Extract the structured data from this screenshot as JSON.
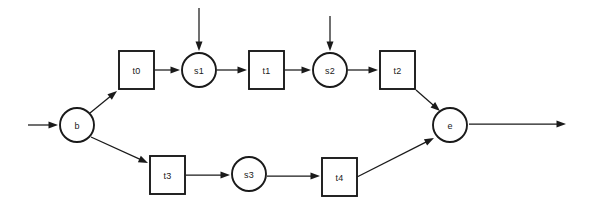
{
  "diagram": {
    "type": "petri-net",
    "width": 596,
    "height": 212,
    "background_color": "#ffffff",
    "stroke_color": "#1a1a1a",
    "places": [
      {
        "id": "b",
        "label": "b",
        "cx": 77,
        "cy": 125,
        "r": 17
      },
      {
        "id": "s1",
        "label": "s1",
        "cx": 199,
        "cy": 70,
        "r": 17
      },
      {
        "id": "s2",
        "label": "s2",
        "cx": 330,
        "cy": 70,
        "r": 17
      },
      {
        "id": "s3",
        "label": "s3",
        "cx": 249,
        "cy": 174,
        "r": 17
      },
      {
        "id": "e",
        "label": "e",
        "cx": 450,
        "cy": 125,
        "r": 17
      }
    ],
    "transitions": [
      {
        "id": "t0",
        "label": "t0",
        "x": 119,
        "y": 51,
        "w": 35,
        "h": 38
      },
      {
        "id": "t1",
        "label": "t1",
        "x": 249,
        "y": 51,
        "w": 35,
        "h": 38
      },
      {
        "id": "t2",
        "label": "t2",
        "x": 380,
        "y": 51,
        "w": 35,
        "h": 38
      },
      {
        "id": "t3",
        "label": "t3",
        "x": 150,
        "y": 156,
        "w": 35,
        "h": 38
      },
      {
        "id": "t4",
        "label": "t4",
        "x": 322,
        "y": 158,
        "w": 35,
        "h": 38
      }
    ],
    "arcs": [
      {
        "id": "arc-in-b",
        "from": "input",
        "to": "b",
        "x1": 28,
        "y1": 125,
        "x2": 58,
        "y2": 125
      },
      {
        "id": "arc-b-t0",
        "from": "b",
        "to": "t0",
        "x1": 90,
        "y1": 113,
        "x2": 117,
        "y2": 91
      },
      {
        "id": "arc-t0-s1",
        "from": "t0",
        "to": "s1",
        "x1": 155,
        "y1": 70,
        "x2": 180,
        "y2": 70
      },
      {
        "id": "arc-in-s1",
        "from": "input",
        "to": "s1",
        "x1": 199,
        "y1": 8,
        "x2": 199,
        "y2": 51
      },
      {
        "id": "arc-s1-t1",
        "from": "s1",
        "to": "t1",
        "x1": 217,
        "y1": 70,
        "x2": 247,
        "y2": 70
      },
      {
        "id": "arc-t1-s2",
        "from": "t1",
        "to": "s2",
        "x1": 285,
        "y1": 70,
        "x2": 311,
        "y2": 70
      },
      {
        "id": "arc-in-s2",
        "from": "input",
        "to": "s2",
        "x1": 330,
        "y1": 16,
        "x2": 330,
        "y2": 51
      },
      {
        "id": "arc-s2-t2",
        "from": "s2",
        "to": "t2",
        "x1": 348,
        "y1": 70,
        "x2": 378,
        "y2": 70
      },
      {
        "id": "arc-t2-e",
        "from": "t2",
        "to": "e",
        "x1": 416,
        "y1": 90,
        "x2": 440,
        "y2": 111
      },
      {
        "id": "arc-b-t3",
        "from": "b",
        "to": "t3",
        "x1": 91,
        "y1": 137,
        "x2": 148,
        "y2": 163
      },
      {
        "id": "arc-t3-s3",
        "from": "t3",
        "to": "s3",
        "x1": 186,
        "y1": 175,
        "x2": 230,
        "y2": 175
      },
      {
        "id": "arc-s3-t4",
        "from": "s3",
        "to": "t4",
        "x1": 267,
        "y1": 176,
        "x2": 320,
        "y2": 176
      },
      {
        "id": "arc-t4-e",
        "from": "t4",
        "to": "e",
        "x1": 357,
        "y1": 177,
        "x2": 434,
        "y2": 138
      },
      {
        "id": "arc-e-output",
        "from": "e",
        "to": "output",
        "x1": 469,
        "y1": 124,
        "x2": 566,
        "y2": 124
      }
    ]
  }
}
